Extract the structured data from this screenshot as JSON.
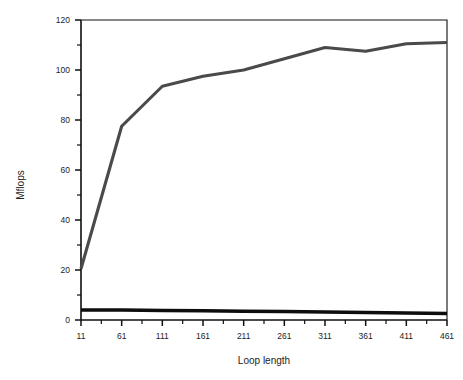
{
  "chart_data": {
    "type": "line",
    "title": "",
    "xlabel": "Loop length",
    "ylabel": "Mflops",
    "xlim": [
      11,
      461
    ],
    "ylim": [
      0,
      120
    ],
    "grid": false,
    "legend": "none",
    "x_tick_labels": [
      "11",
      "61",
      "111",
      "161",
      "211",
      "261",
      "311",
      "361",
      "411",
      "461"
    ],
    "y_tick_labels": [
      "0",
      "20",
      "40",
      "60",
      "80",
      "100",
      "120"
    ],
    "x_minor_tick_count_between": 1,
    "y_minor_tick_count_between": 1,
    "x": [
      11,
      61,
      111,
      161,
      211,
      261,
      311,
      361,
      411,
      461
    ],
    "series": [
      {
        "name": "upper-curve",
        "color": "#4a4a4a",
        "values": [
          20.5,
          77.5,
          93.5,
          97.5,
          100.0,
          104.5,
          109.0,
          107.5,
          110.5,
          111.0
        ]
      },
      {
        "name": "lower-curve",
        "color": "#0d0d0d",
        "values": [
          4.0,
          4.0,
          3.8,
          3.7,
          3.5,
          3.4,
          3.2,
          3.0,
          2.8,
          2.6
        ]
      }
    ]
  },
  "axes": {
    "x_axis_title": "Loop length",
    "y_axis_title": "Mflops"
  }
}
